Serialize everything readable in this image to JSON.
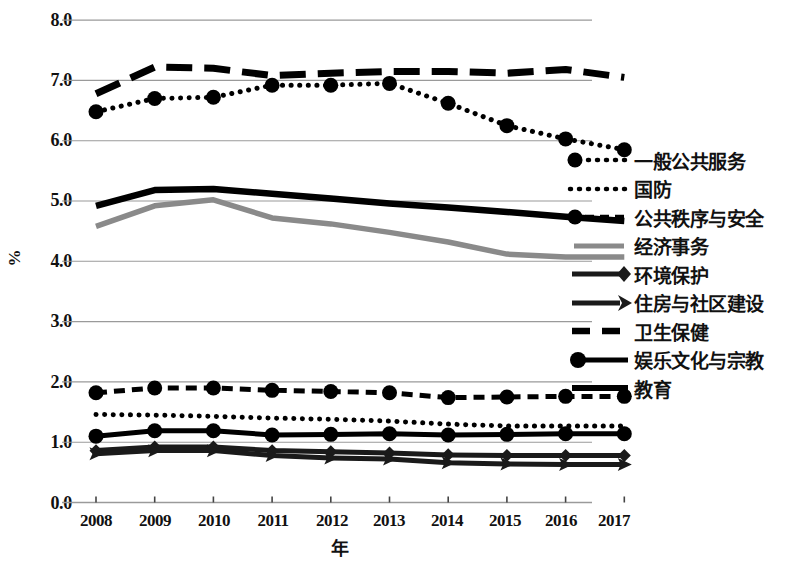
{
  "chart_data": {
    "type": "line",
    "title": "",
    "xlabel": "年",
    "ylabel": "%",
    "categories": [
      "2008",
      "2009",
      "2010",
      "2011",
      "2012",
      "2013",
      "2014",
      "2015",
      "2016",
      "2017"
    ],
    "x": [
      2008,
      2009,
      2010,
      2011,
      2012,
      2013,
      2014,
      2015,
      2016,
      2017
    ],
    "ylim": [
      0.0,
      8.0
    ],
    "yticks": [
      "0.0",
      "1.0",
      "2.0",
      "3.0",
      "4.0",
      "5.0",
      "6.0",
      "7.0",
      "8.0"
    ],
    "ytick_values": [
      0.0,
      1.0,
      2.0,
      3.0,
      4.0,
      5.0,
      6.0,
      7.0,
      8.0
    ],
    "grid": "horizontal",
    "legend_position": "right",
    "series": [
      {
        "name": "一般公共服务",
        "style": "dotted-with-circle-markers",
        "color": "#000000",
        "values": [
          6.48,
          6.7,
          6.72,
          6.92,
          6.92,
          6.95,
          6.62,
          6.25,
          6.03,
          5.85
        ]
      },
      {
        "name": "国防",
        "style": "dotted",
        "color": "#000000",
        "values": [
          1.46,
          1.45,
          1.43,
          1.4,
          1.38,
          1.35,
          1.3,
          1.27,
          1.27,
          1.27
        ]
      },
      {
        "name": "公共秩序与安全",
        "style": "dashed-with-circle-markers",
        "color": "#000000",
        "values": [
          1.82,
          1.9,
          1.9,
          1.86,
          1.84,
          1.82,
          1.74,
          1.75,
          1.76,
          1.76
        ]
      },
      {
        "name": "经济事务",
        "style": "solid-gray",
        "color": "#8a8a8a",
        "values": [
          4.58,
          4.92,
          5.02,
          4.72,
          4.62,
          4.48,
          4.32,
          4.12,
          4.07,
          4.07
        ]
      },
      {
        "name": "环境保护",
        "style": "solid-with-diamond-markers",
        "color": "#1a1a1a",
        "values": [
          0.86,
          0.92,
          0.92,
          0.86,
          0.84,
          0.82,
          0.79,
          0.78,
          0.78,
          0.78
        ]
      },
      {
        "name": "住房与社区建设",
        "style": "solid-with-arrow-markers",
        "color": "#1a1a1a",
        "values": [
          0.81,
          0.86,
          0.86,
          0.78,
          0.74,
          0.72,
          0.66,
          0.64,
          0.63,
          0.63
        ]
      },
      {
        "name": "卫生保健",
        "style": "thick-dashed",
        "color": "#000000",
        "values": [
          6.78,
          7.22,
          7.2,
          7.08,
          7.12,
          7.15,
          7.15,
          7.12,
          7.18,
          7.05
        ]
      },
      {
        "name": "娱乐文化与宗教",
        "style": "solid-with-large-circle-markers",
        "color": "#000000",
        "values": [
          1.1,
          1.19,
          1.19,
          1.12,
          1.13,
          1.14,
          1.12,
          1.13,
          1.14,
          1.14
        ]
      },
      {
        "name": "教育",
        "style": "thick-solid",
        "color": "#000000",
        "values": [
          4.92,
          5.18,
          5.2,
          5.12,
          5.04,
          4.96,
          4.89,
          4.82,
          4.74,
          4.67
        ]
      }
    ]
  },
  "axes": {
    "y_axis_title": "%",
    "x_axis_title": "年",
    "y_tick_labels": [
      "8.0",
      "7.0",
      "6.0",
      "5.0",
      "4.0",
      "3.0",
      "2.0",
      "1.0",
      "0.0"
    ],
    "x_tick_labels": [
      "2008",
      "2009",
      "2010",
      "2011",
      "2012",
      "2013",
      "2014",
      "2015",
      "2016",
      "2017"
    ]
  },
  "legend": {
    "items": [
      {
        "label": "一般公共服务",
        "key": "dotted-circle-key"
      },
      {
        "label": "国防",
        "key": "dotted-key"
      },
      {
        "label": "公共秩序与安全",
        "key": "dashed-circle-key"
      },
      {
        "label": "经济事务",
        "key": "gray-solid-key"
      },
      {
        "label": "环境保护",
        "key": "diamond-key"
      },
      {
        "label": "住房与社区建设",
        "key": "arrow-key"
      },
      {
        "label": "卫生保健",
        "key": "thick-dashed-key"
      },
      {
        "label": "娱乐文化与宗教",
        "key": "circle-solid-key"
      },
      {
        "label": "教育",
        "key": "thick-solid-key"
      }
    ]
  },
  "colors": {
    "ink": "#000000",
    "gray_series": "#8a8a8a",
    "gridline": "#9a9a9a",
    "background": "#ffffff"
  }
}
